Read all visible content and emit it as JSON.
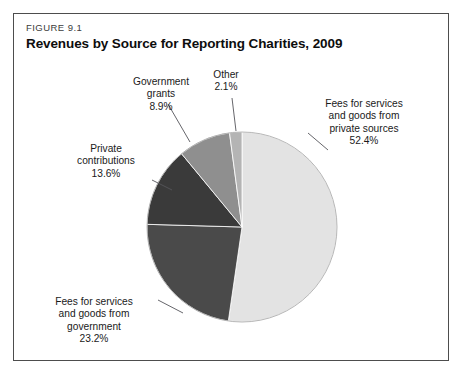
{
  "figure": {
    "number": "FIGURE 9.1",
    "title": "Revenues by Source for Reporting Charities, 2009"
  },
  "labels": {
    "private_sources": "Fees for services\nand goods from\nprivate sources\n52.4%",
    "other": "Other\n2.1%",
    "gov_grants": "Government\ngrants\n8.9%",
    "private_contrib": "Private\ncontributions\n13.6%",
    "fees_gov": "Fees for services\nand goods from\ngovernment\n23.2%"
  },
  "chart_data": {
    "type": "pie",
    "title": "Revenues by Source for Reporting Charities, 2009",
    "xlabel": "",
    "ylabel": "",
    "legend": "none",
    "grid": false,
    "unit": "percent",
    "categories": [
      "Fees for services and goods from private sources",
      "Fees for services and goods from government",
      "Private contributions",
      "Government grants",
      "Other"
    ],
    "values": [
      52.4,
      23.2,
      13.6,
      8.9,
      2.1
    ],
    "colors": [
      "#e3e3e3",
      "#4a4a4a",
      "#3a3a3a",
      "#8f8f8f",
      "#b4b4b4"
    ],
    "slices": [
      {
        "name": "Fees for services and goods from private sources",
        "value": 52.4,
        "color": "#e3e3e3",
        "start_angle": 0,
        "end_angle": 188.64
      },
      {
        "name": "Fees for services and goods from government",
        "value": 23.2,
        "color": "#4a4a4a",
        "start_angle": 188.64,
        "end_angle": 272.16
      },
      {
        "name": "Private contributions",
        "value": 13.6,
        "color": "#3a3a3a",
        "start_angle": 272.16,
        "end_angle": 321.12
      },
      {
        "name": "Government grants",
        "value": 8.9,
        "color": "#8f8f8f",
        "start_angle": 321.12,
        "end_angle": 353.16
      },
      {
        "name": "Other",
        "value": 2.1,
        "color": "#b4b4b4",
        "start_angle": 353.16,
        "end_angle": 360
      }
    ],
    "total": 100.2,
    "start_angle_deg": 0,
    "direction": "clockwise",
    "center": [
      242,
      227
    ],
    "radius": 95
  }
}
